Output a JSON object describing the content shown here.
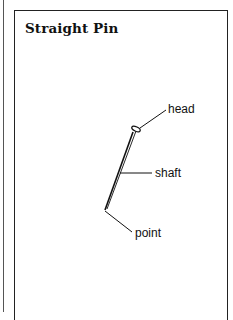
{
  "title": "Straight Pin",
  "labels": {
    "head": "head",
    "shaft": "shaft",
    "point": "point"
  },
  "colors": {
    "line": "#111111",
    "background": "#ffffff"
  }
}
